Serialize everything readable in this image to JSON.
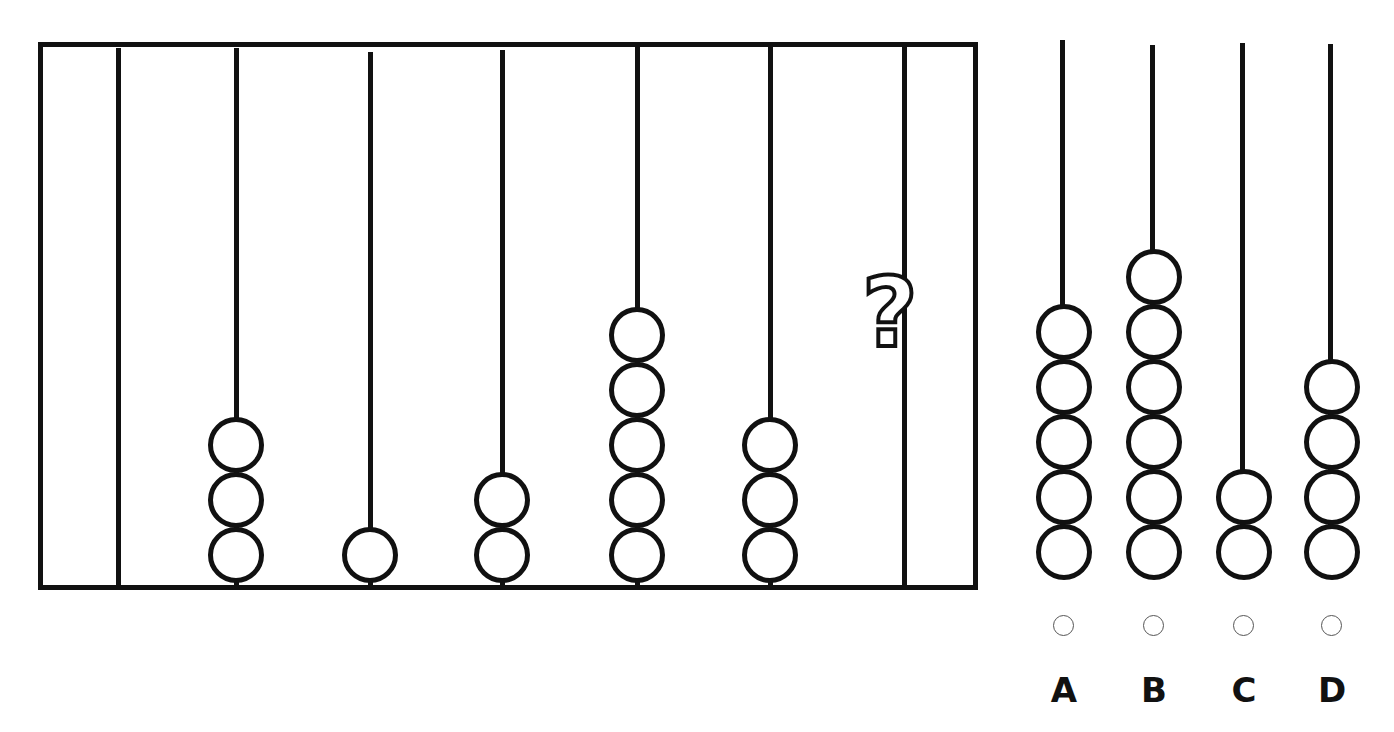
{
  "puzzle": {
    "type": "abacus-sequence",
    "question_mark": "?",
    "rods": [
      {
        "index": 1,
        "beads": 0
      },
      {
        "index": 2,
        "beads": 3
      },
      {
        "index": 3,
        "beads": 1
      },
      {
        "index": 4,
        "beads": 2
      },
      {
        "index": 5,
        "beads": 5
      },
      {
        "index": 6,
        "beads": 3
      },
      {
        "index": 7,
        "beads": null,
        "unknown": true
      }
    ]
  },
  "options": [
    {
      "label": "A",
      "beads": 5
    },
    {
      "label": "B",
      "beads": 6
    },
    {
      "label": "C",
      "beads": 2
    },
    {
      "label": "D",
      "beads": 4
    }
  ],
  "colors": {
    "stroke": "#111111",
    "background": "#ffffff",
    "radio_border": "#555555"
  }
}
